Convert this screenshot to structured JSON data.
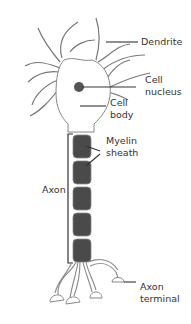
{
  "diagram": {
    "labels": {
      "dendrite": "Dendrite",
      "cell_nucleus_line1": "Cell",
      "cell_nucleus_line2": "nucleus",
      "cell_body_line1": "Cell",
      "cell_body_line2": "body",
      "myelin_line1": "Myelin",
      "myelin_line2": "sheath",
      "axon": "Axon",
      "axon_terminal_line1": "Axon",
      "axon_terminal_line2": "terminal"
    },
    "colors": {
      "outline": "#777777",
      "myelin_fill": "#4a4a4a",
      "nucleus_fill": "#555555",
      "leader_line": "#333333"
    },
    "myelin_segments": 5
  }
}
